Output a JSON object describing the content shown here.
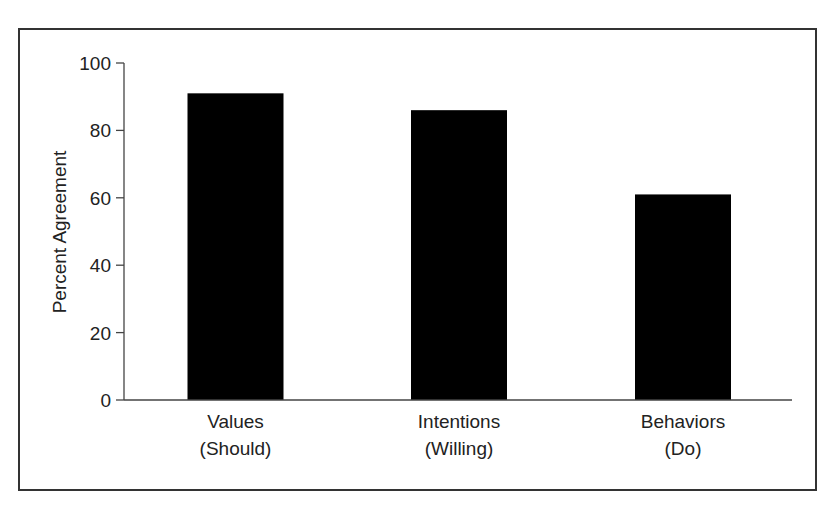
{
  "chart_data": {
    "type": "bar",
    "title": "",
    "xlabel": "",
    "ylabel": "Percent Agreement",
    "ylim": [
      0,
      100
    ],
    "yticks": [
      0,
      20,
      40,
      60,
      80,
      100
    ],
    "grid": false,
    "legend": null,
    "categories": [
      "Values (Should)",
      "Intentions (Willing)",
      "Behaviors (Do)"
    ],
    "category_lines": [
      [
        "Values",
        "(Should)"
      ],
      [
        "Intentions",
        "(Willing)"
      ],
      [
        "Behaviors",
        "(Do)"
      ]
    ],
    "values": [
      91,
      86,
      61
    ],
    "bar_color": "#000000"
  }
}
